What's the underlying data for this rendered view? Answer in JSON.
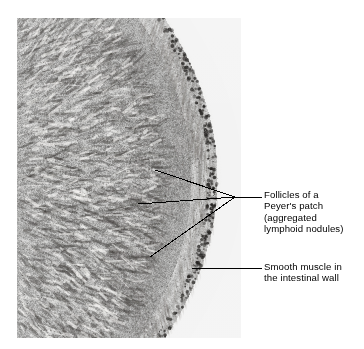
{
  "figure": {
    "type": "light-micrograph",
    "background_color": "#ffffff",
    "tissue_tint": "#b9b4ac"
  },
  "micrograph": {
    "name": "intestine-peyers-patch-micrograph",
    "x": 17,
    "y": 18,
    "width": 224,
    "height": 320,
    "plate_color": "#f2f1ef"
  },
  "annotations": {
    "leader_color": "#000000",
    "leader_width": 1,
    "labels": [
      {
        "id": "follicles",
        "name": "label-follicles",
        "lines": [
          "Follicles of a",
          "Peyer's patch",
          "(aggregated",
          "lymphoid nodules)"
        ],
        "converge": {
          "x": 235,
          "y": 197
        },
        "stem": {
          "x1": 235,
          "y1": 197,
          "x2": 262,
          "y2": 197
        },
        "leaders": [
          {
            "x1": 155,
            "y1": 170,
            "x2": 235,
            "y2": 197
          },
          {
            "x1": 138,
            "y1": 204,
            "x2": 235,
            "y2": 197
          },
          {
            "x1": 150,
            "y1": 257,
            "x2": 235,
            "y2": 197
          }
        ]
      },
      {
        "id": "smooth-muscle",
        "name": "label-smooth-muscle",
        "lines": [
          "Smooth muscle in",
          "the intestinal wall"
        ],
        "stem": {
          "x1": 192,
          "y1": 268,
          "x2": 262,
          "y2": 268
        },
        "leaders": [
          {
            "x1": 192,
            "y1": 268,
            "x2": 262,
            "y2": 268
          }
        ]
      }
    ]
  },
  "chart_data": {
    "type": "heatmap",
    "title": ""
  }
}
